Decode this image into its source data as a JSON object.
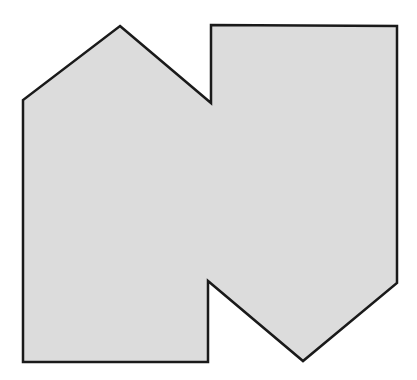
{
  "canvas": {
    "width": 417,
    "height": 380,
    "background_color": "#ffffff",
    "title": "Irregular polygon figure"
  },
  "figure": {
    "name": "irregular-polygon",
    "fill_color": "#dcdcdc",
    "stroke_color": "#1a1a1a",
    "stroke_width": 2.5,
    "vertex_count": 10,
    "vertices": [
      [
        120,
        26
      ],
      [
        211,
        103
      ],
      [
        211,
        25
      ],
      [
        397,
        26
      ],
      [
        397,
        283
      ],
      [
        303,
        361
      ],
      [
        208,
        281
      ],
      [
        208,
        362
      ],
      [
        23,
        362
      ],
      [
        23,
        100
      ]
    ],
    "path_d": "M 120 26 L 211 103 L 211 25 L 397 26 L 397 283 L 303 361 L 208 281 L 208 362 L 23 362 L 23 100 Z"
  }
}
